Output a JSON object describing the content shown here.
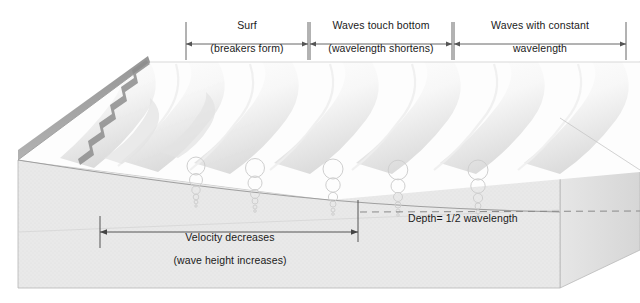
{
  "diagram": {
    "type": "block-diagram",
    "colors": {
      "ink": "#1a1a1a",
      "rule": "#555555",
      "block_top": "#ebebeb",
      "block_front": "#e3e3e3",
      "block_side": "#dcdcdc",
      "water": "#fbfbfb",
      "wave_shade": "#dddddd",
      "beach_dark": "#9a9a9a",
      "orbit_stroke": "#cfcfcf",
      "dashed": "#8a8a8a"
    },
    "zones": [
      {
        "id": "surf",
        "line1": "Surf",
        "line2": "(breakers form)",
        "x_start": 186,
        "x_end": 308
      },
      {
        "id": "touch-bottom",
        "line1": "Waves touch bottom",
        "line2": "(wavelength shortens)",
        "x_start": 310,
        "x_end": 452
      },
      {
        "id": "constant-length",
        "line1": "Waves with constant",
        "line2": "wavelength",
        "x_start": 454,
        "x_end": 626
      }
    ],
    "annotations": {
      "velocity": {
        "line1": "Velocity decreases",
        "line2": "(wave height increases)",
        "x_start": 100,
        "x_end": 358,
        "y": 232
      },
      "depth": {
        "text": "Depth= 1/2 wavelength",
        "dashed_y": 212,
        "dashed_x_start": 360,
        "dashed_x_end": 640
      }
    },
    "orbitals": {
      "description": "columns of orbital circles diminishing with depth",
      "columns_x": [
        196,
        255,
        333,
        398,
        478
      ],
      "circle_counts": [
        6,
        6,
        6,
        6,
        6
      ]
    },
    "wave_crest_count": 6,
    "shoreline": {
      "label": "beach",
      "foam_scallops": 8
    }
  }
}
